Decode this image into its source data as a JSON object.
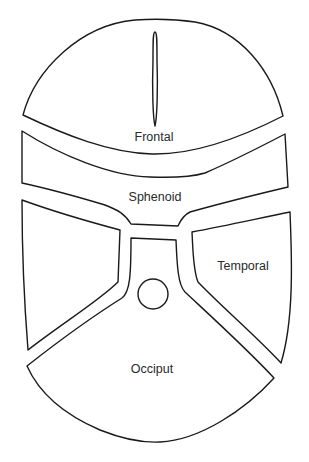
{
  "diagram": {
    "type": "skull-bones-schematic",
    "stroke_color": "#1a1a1a",
    "background": "#ffffff",
    "regions": [
      {
        "id": "frontal",
        "label": "Frontal"
      },
      {
        "id": "sphenoid",
        "label": "Sphenoid"
      },
      {
        "id": "temporal",
        "label": "Temporal"
      },
      {
        "id": "occiput",
        "label": "Occiput"
      }
    ]
  }
}
